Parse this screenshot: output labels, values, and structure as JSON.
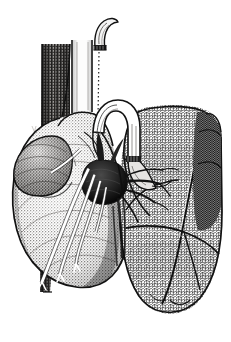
{
  "figure": {
    "domain": "anatomical-line-illustration",
    "medium": "pen-and-ink stipple engraving",
    "background_color": "#ffffff",
    "ink_color": "#121212",
    "canvas": {
      "width": 231,
      "height": 342
    },
    "caption": "",
    "labels": [],
    "visible_text": []
  },
  "palette": {
    "paper": "#ffffff",
    "ink": "#121212",
    "heart_midtone": "#b4b0ac",
    "heart_shadow": "#6f6b68",
    "hilum_dark": "#1a1a1a",
    "column_dark": "#3b3b3b",
    "lung_tone": "#fbfbfb",
    "vessel_highlight": "#ffffff"
  },
  "structures": [
    {
      "id": "descending-aorta-column",
      "name": "Descending aorta / posterior mediastinal column",
      "region": "upper-left",
      "bbox": [
        40,
        40,
        30,
        250
      ],
      "shading": "dense vertical stipple, dark",
      "tone": "#3b3b3b"
    },
    {
      "id": "trachea-tube",
      "name": "Trachea / superior vena cava tube",
      "region": "upper-center",
      "bbox": [
        70,
        38,
        18,
        80
      ],
      "shading": "pale with outlined walls",
      "tone": "#f2f2f2"
    },
    {
      "id": "cut-vessel-stump",
      "name": "Curved cut vessel stump with ligature band",
      "region": "top-center",
      "bbox": [
        86,
        20,
        26,
        28
      ],
      "shading": "tapering hook, dark banded base",
      "tone": "#2a2a2a"
    },
    {
      "id": "dotted-guide-line",
      "name": "Dotted guide / suture line",
      "region": "top-center",
      "bbox": [
        96,
        46,
        2,
        72
      ],
      "shading": "fine vertical dotted stroke",
      "tone": "#333333"
    },
    {
      "id": "aortic-arch",
      "name": "Aortic arch",
      "region": "center-top",
      "bbox": [
        88,
        98,
        52,
        62
      ],
      "shading": "outlined tube, white lumen with hatch edges",
      "tone": "#ffffff"
    },
    {
      "id": "pulmonary-trunk",
      "name": "Pulmonary trunk descending to hilum",
      "region": "center",
      "bbox": [
        118,
        140,
        26,
        38
      ],
      "shading": "banded, clamped segment",
      "tone": "#d8d8d8"
    },
    {
      "id": "heart-body",
      "name": "Heart — ventricular mass",
      "region": "left-center",
      "bbox": [
        12,
        120,
        112,
        172
      ],
      "shading": "fine stipple, rounded apex lower right",
      "tone": "#b4b0ac"
    },
    {
      "id": "auricle-left",
      "name": "Left atrial appendage / auricle",
      "region": "left",
      "bbox": [
        14,
        140,
        48,
        52
      ],
      "shading": "lobed, darker stipple",
      "tone": "#9d9894"
    },
    {
      "id": "hilum-mass",
      "name": "Pulmonary hilum root (dark mass)",
      "region": "center",
      "bbox": [
        84,
        160,
        46,
        42
      ],
      "shading": "solid black with radiating branches",
      "tone": "#1a1a1a"
    },
    {
      "id": "coronary-vessels",
      "name": "Coronary vessels on ventricle surface",
      "region": "center-left",
      "bbox": [
        38,
        170,
        66,
        110
      ],
      "shading": "white highlighted ribbons fanning downward",
      "tone": "#ffffff"
    },
    {
      "id": "lung-left",
      "name": "Lung with reticular alveolar texture",
      "region": "right",
      "bbox": [
        118,
        110,
        106,
        200
      ],
      "shading": "fine cellular reticular mesh",
      "tone": "#fbfbfb"
    },
    {
      "id": "lung-oblique-fissure",
      "name": "Oblique fissure of lung",
      "region": "right",
      "bbox": [
        170,
        120,
        40,
        190
      ],
      "shading": "dark dividing line between lobes",
      "tone": "#121212"
    },
    {
      "id": "lung-posterior-border",
      "name": "Posterior lung border (darker segment)",
      "region": "right-edge",
      "bbox": [
        196,
        118,
        26,
        110
      ],
      "shading": "heavier cross-hatch",
      "tone": "#6a6a6a"
    },
    {
      "id": "lung-lower-lobe",
      "name": "Lower lobe of lung",
      "region": "bottom-right",
      "bbox": [
        122,
        230,
        96,
        82
      ],
      "shading": "reticular mesh, tapering inferior margin",
      "tone": "#fbfbfb"
    },
    {
      "id": "hilar-branches",
      "name": "Bronchial and vascular branches entering lung",
      "region": "center-right",
      "bbox": [
        120,
        170,
        54,
        30
      ],
      "shading": "dark radiating strokes",
      "tone": "#121212"
    }
  ]
}
